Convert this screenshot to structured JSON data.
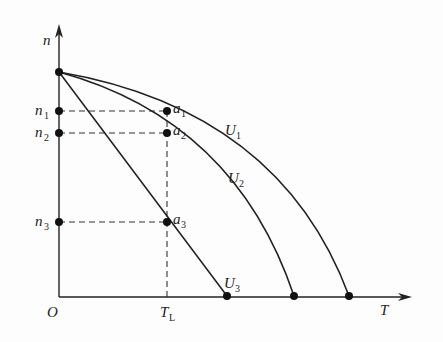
{
  "diagram": {
    "type": "motor speed-torque characteristics",
    "axes": {
      "y_label": "n",
      "x_label": "T",
      "origin_label": "O"
    },
    "y_ticks": [
      {
        "main": "n",
        "sub": "1"
      },
      {
        "main": "n",
        "sub": "2"
      },
      {
        "main": "n",
        "sub": "3"
      }
    ],
    "x_ticks": [
      {
        "main": "T",
        "sub": "L"
      }
    ],
    "points": [
      {
        "main": "a",
        "sub": "1"
      },
      {
        "main": "a",
        "sub": "2"
      },
      {
        "main": "a",
        "sub": "3"
      }
    ],
    "curves": [
      {
        "main": "U",
        "sub": "1",
        "shape": "curved"
      },
      {
        "main": "U",
        "sub": "2",
        "shape": "curved"
      },
      {
        "main": "U",
        "sub": "3",
        "shape": "straight"
      }
    ],
    "colors": {
      "line": "#222222",
      "background": "#fdfdfd"
    }
  }
}
